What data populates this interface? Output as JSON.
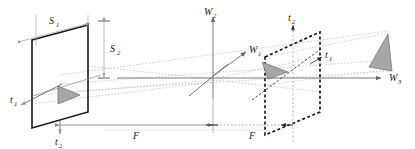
{
  "figure": {
    "type": "technical-line-diagram",
    "width": 415,
    "height": 149,
    "background": "#ffffff"
  },
  "colors": {
    "solid_plane": "#1a1a1a",
    "dashed_plane": "#1a1a1a",
    "axis": "#6b6b6b",
    "ray": "#a8a8a8",
    "dimension": "#8a8a8a",
    "triangle_fill": "#a6a6a6",
    "triangle_stroke": "#6e6e6e",
    "label": "#1a1a1a"
  },
  "labels": {
    "s1": {
      "base": "S",
      "sub": "1"
    },
    "s2": {
      "base": "S",
      "sub": "2"
    },
    "t1_left": {
      "base": "t",
      "sub": "1"
    },
    "t2_left": {
      "base": "t",
      "sub": "2"
    },
    "t1_right": {
      "base": "t",
      "sub": "1"
    },
    "t2_right": {
      "base": "t",
      "sub": "2"
    },
    "w1": {
      "base": "W",
      "sub": "1"
    },
    "w2": {
      "base": "W",
      "sub": "2"
    },
    "w3": {
      "base": "W",
      "sub": "3"
    },
    "f_left": {
      "base": "F",
      "sub": ""
    },
    "f_right": {
      "base": "F",
      "sub": ""
    }
  },
  "elements": {
    "object_plane": "solid-parallelogram-left",
    "image_plane": "dashed-parallelogram-right",
    "object_triangle": "gray-triangle-on-object-plane",
    "image_triangle": "gray-triangle-on-image-plane",
    "virtual_triangle": "gray-triangle-right-of-image-plane",
    "optical_axis": "W3",
    "vertical_axis": "W2",
    "depth_axis": "W1",
    "focal_length_left": "F",
    "focal_length_right": "F"
  }
}
